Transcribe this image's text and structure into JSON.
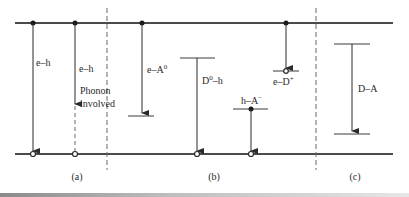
{
  "figure": {
    "colors": {
      "line": "#3a3a3a",
      "band": "#4a4a4a",
      "dash": "#6a6a6a"
    },
    "bands": {
      "conduction_y": 23,
      "valence_y": 154,
      "x_start": 15,
      "x_end": 393
    },
    "dividers": [
      {
        "name": "divider-a-b",
        "x": 107
      },
      {
        "name": "divider-b-c",
        "x": 316
      }
    ],
    "panel_labels": [
      {
        "name": "panel-label-a",
        "text": "(a)",
        "x": 77,
        "y": 180
      },
      {
        "name": "panel-label-b",
        "text": "(b)",
        "x": 214,
        "y": 180
      },
      {
        "name": "panel-label-c",
        "text": "(c)",
        "x": 355,
        "y": 180
      }
    ],
    "transitions": [
      {
        "id": "e-h-direct",
        "label": "e–h",
        "label_x": 36,
        "label_y": 66
      },
      {
        "id": "e-h-phonon",
        "label": "e–h",
        "label_x": 79,
        "label_y": 72,
        "note_line1": "Phonon",
        "note_line2": "involved",
        "note_x": 80,
        "note_y1": 94,
        "note_y2": 107
      },
      {
        "id": "e-A0",
        "label": "e–A",
        "sup": "0",
        "label_x": 147,
        "label_y": 73
      },
      {
        "id": "D0-h",
        "label_pre": "D",
        "sup": "0",
        "label_post": "–h",
        "label_x": 202,
        "label_y": 84
      },
      {
        "id": "h-A-minus",
        "label": "h–A",
        "sup": "−",
        "label_x": 241,
        "label_y": 105
      },
      {
        "id": "e-D-plus",
        "label": "e–D",
        "sup": "+",
        "label_x": 273,
        "label_y": 85
      },
      {
        "id": "D-A",
        "label": "D–A",
        "label_x": 358,
        "label_y": 92
      }
    ]
  }
}
